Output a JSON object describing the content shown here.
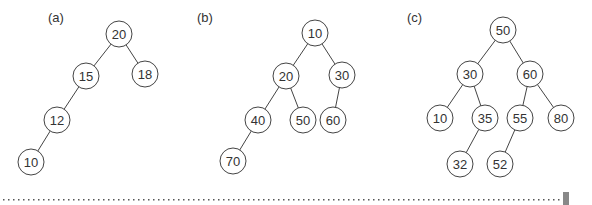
{
  "trees": [
    {
      "label": "(a)",
      "label_pos": [
        48,
        22
      ],
      "nodes": [
        {
          "id": "a20",
          "value": "20",
          "x": 119,
          "y": 34
        },
        {
          "id": "a15",
          "value": "15",
          "x": 86,
          "y": 76
        },
        {
          "id": "a18",
          "value": "18",
          "x": 145,
          "y": 74
        },
        {
          "id": "a12",
          "value": "12",
          "x": 57,
          "y": 120
        },
        {
          "id": "a10",
          "value": "10",
          "x": 31,
          "y": 162
        }
      ],
      "edges": [
        [
          "a20",
          "a15"
        ],
        [
          "a20",
          "a18"
        ],
        [
          "a15",
          "a12"
        ],
        [
          "a12",
          "a10"
        ]
      ]
    },
    {
      "label": "(b)",
      "label_pos": [
        197,
        22
      ],
      "nodes": [
        {
          "id": "b10",
          "value": "10",
          "x": 315,
          "y": 33
        },
        {
          "id": "b20",
          "value": "20",
          "x": 286,
          "y": 76
        },
        {
          "id": "b30",
          "value": "30",
          "x": 342,
          "y": 75
        },
        {
          "id": "b40",
          "value": "40",
          "x": 258,
          "y": 120
        },
        {
          "id": "b50",
          "value": "50",
          "x": 303,
          "y": 120
        },
        {
          "id": "b60",
          "value": "60",
          "x": 333,
          "y": 120
        },
        {
          "id": "b70",
          "value": "70",
          "x": 233,
          "y": 161
        }
      ],
      "edges": [
        [
          "b10",
          "b20"
        ],
        [
          "b10",
          "b30"
        ],
        [
          "b20",
          "b40"
        ],
        [
          "b20",
          "b50"
        ],
        [
          "b30",
          "b60"
        ],
        [
          "b40",
          "b70"
        ]
      ]
    },
    {
      "label": "(c)",
      "label_pos": [
        407,
        22
      ],
      "nodes": [
        {
          "id": "c50",
          "value": "50",
          "x": 503,
          "y": 30
        },
        {
          "id": "c30",
          "value": "30",
          "x": 470,
          "y": 74
        },
        {
          "id": "c60",
          "value": "60",
          "x": 530,
          "y": 74
        },
        {
          "id": "c10",
          "value": "10",
          "x": 440,
          "y": 118
        },
        {
          "id": "c35",
          "value": "35",
          "x": 485,
          "y": 118
        },
        {
          "id": "c55",
          "value": "55",
          "x": 520,
          "y": 118
        },
        {
          "id": "c80",
          "value": "80",
          "x": 561,
          "y": 118
        },
        {
          "id": "c32",
          "value": "32",
          "x": 460,
          "y": 164
        },
        {
          "id": "c52",
          "value": "52",
          "x": 500,
          "y": 164
        }
      ],
      "edges": [
        [
          "c50",
          "c30"
        ],
        [
          "c50",
          "c60"
        ],
        [
          "c30",
          "c10"
        ],
        [
          "c30",
          "c35"
        ],
        [
          "c60",
          "c55"
        ],
        [
          "c60",
          "c80"
        ],
        [
          "c35",
          "c32"
        ],
        [
          "c55",
          "c52"
        ]
      ]
    }
  ],
  "node_radius": 13,
  "separator": {
    "y": 199,
    "x1": 3,
    "x2": 563,
    "color": "#555555"
  },
  "marker": {
    "x": 563,
    "y": 192,
    "w": 6,
    "h": 13,
    "color": "#888888"
  }
}
